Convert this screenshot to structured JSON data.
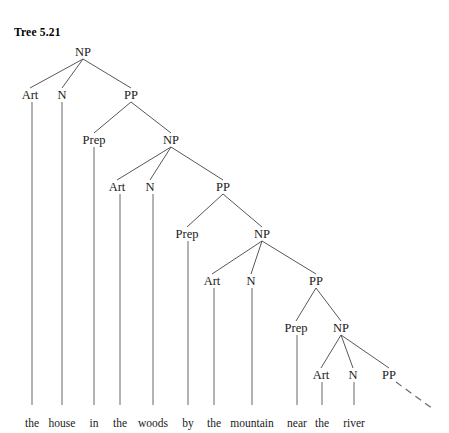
{
  "figure": {
    "caption": "Tree 5.21",
    "caption_x": 14,
    "caption_y": 26,
    "width": 449,
    "height": 433,
    "background": "#ffffff",
    "line_color": "#444444",
    "text_color": "#1a1a1a"
  },
  "tree": {
    "type": "syntax-tree",
    "sentence": "the house in the woods by the mountain near the river",
    "description": "Recursive noun phrase with nested prepositional phrases, showing NP -> Art N PP recursion continuing indefinitely",
    "nodes": [
      {
        "id": "np1",
        "label": "NP",
        "x": 83,
        "y": 52
      },
      {
        "id": "art1",
        "label": "Art",
        "x": 30,
        "y": 95
      },
      {
        "id": "n1",
        "label": "N",
        "x": 62,
        "y": 95
      },
      {
        "id": "pp1",
        "label": "PP",
        "x": 131,
        "y": 95
      },
      {
        "id": "prep1",
        "label": "Prep",
        "x": 94,
        "y": 140
      },
      {
        "id": "np2",
        "label": "NP",
        "x": 171,
        "y": 140
      },
      {
        "id": "art2",
        "label": "Art",
        "x": 117,
        "y": 187
      },
      {
        "id": "n2",
        "label": "N",
        "x": 150,
        "y": 187
      },
      {
        "id": "pp2",
        "label": "PP",
        "x": 223,
        "y": 187
      },
      {
        "id": "prep2",
        "label": "Prep",
        "x": 187,
        "y": 234
      },
      {
        "id": "np3",
        "label": "NP",
        "x": 262,
        "y": 234
      },
      {
        "id": "art3",
        "label": "Art",
        "x": 212,
        "y": 281
      },
      {
        "id": "n3",
        "label": "N",
        "x": 251,
        "y": 281
      },
      {
        "id": "pp3",
        "label": "PP",
        "x": 316,
        "y": 281
      },
      {
        "id": "prep3",
        "label": "Prep",
        "x": 296,
        "y": 328
      },
      {
        "id": "np4",
        "label": "NP",
        "x": 341,
        "y": 328
      },
      {
        "id": "art4",
        "label": "Art",
        "x": 321,
        "y": 375
      },
      {
        "id": "n4",
        "label": "N",
        "x": 353,
        "y": 375
      },
      {
        "id": "pp4",
        "label": "PP",
        "x": 389,
        "y": 375
      }
    ],
    "branches": [
      {
        "from": "np1",
        "to": "art1"
      },
      {
        "from": "np1",
        "to": "n1"
      },
      {
        "from": "np1",
        "to": "pp1"
      },
      {
        "from": "pp1",
        "to": "prep1"
      },
      {
        "from": "pp1",
        "to": "np2"
      },
      {
        "from": "np2",
        "to": "art2"
      },
      {
        "from": "np2",
        "to": "n2"
      },
      {
        "from": "np2",
        "to": "pp2"
      },
      {
        "from": "pp2",
        "to": "prep2"
      },
      {
        "from": "pp2",
        "to": "np3"
      },
      {
        "from": "np3",
        "to": "art3"
      },
      {
        "from": "np3",
        "to": "n3"
      },
      {
        "from": "np3",
        "to": "pp3"
      },
      {
        "from": "pp3",
        "to": "prep3"
      },
      {
        "from": "pp3",
        "to": "np4"
      },
      {
        "from": "np4",
        "to": "art4"
      },
      {
        "from": "np4",
        "to": "n4"
      },
      {
        "from": "np4",
        "to": "pp4"
      }
    ],
    "terminals": [
      {
        "id": "t-the1",
        "word": "the",
        "x": 32,
        "y": 418,
        "parent": "art1",
        "stem_top": 102
      },
      {
        "id": "t-house",
        "word": "house",
        "x": 62,
        "y": 418,
        "parent": "n1",
        "stem_top": 102
      },
      {
        "id": "t-in",
        "word": "in",
        "x": 94,
        "y": 418,
        "parent": "prep1",
        "stem_top": 147
      },
      {
        "id": "t-the2",
        "word": "the",
        "x": 120,
        "y": 418,
        "parent": "art2",
        "stem_top": 194
      },
      {
        "id": "t-woods",
        "word": "woods",
        "x": 153,
        "y": 418,
        "parent": "n2",
        "stem_top": 194
      },
      {
        "id": "t-by",
        "word": "by",
        "x": 188,
        "y": 418,
        "parent": "prep2",
        "stem_top": 241
      },
      {
        "id": "t-the3",
        "word": "the",
        "x": 214,
        "y": 418,
        "parent": "art3",
        "stem_top": 288
      },
      {
        "id": "t-mountain",
        "word": "mountain",
        "x": 252,
        "y": 418,
        "parent": "n3",
        "stem_top": 288
      },
      {
        "id": "t-near",
        "word": "near",
        "x": 297,
        "y": 418,
        "parent": "prep3",
        "stem_top": 335
      },
      {
        "id": "t-the4",
        "word": "the",
        "x": 322,
        "y": 418,
        "parent": "art4",
        "stem_top": 382
      },
      {
        "id": "t-river",
        "word": "river",
        "x": 354,
        "y": 418,
        "parent": "n4",
        "stem_top": 382
      }
    ],
    "recursion_edge": {
      "label": "dashed-continuation",
      "x1": 396,
      "y1": 382,
      "x2": 433,
      "y2": 409
    },
    "stem_bottom": 405
  }
}
